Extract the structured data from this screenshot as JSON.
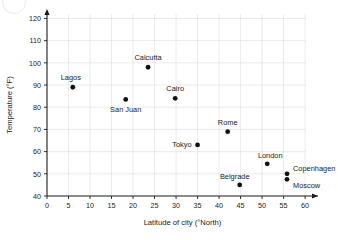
{
  "chart_data": {
    "type": "scatter",
    "title": "",
    "xlabel": "Latitude of city (°North)",
    "ylabel": "Temperature (°F)",
    "xlim": [
      0,
      63
    ],
    "ylim": [
      40,
      122
    ],
    "xticks": [
      0,
      5,
      10,
      15,
      20,
      25,
      30,
      35,
      40,
      45,
      50,
      55,
      60
    ],
    "yticks": [
      40,
      50,
      60,
      70,
      80,
      90,
      100,
      110,
      120
    ],
    "xtick_labels": [
      "0",
      "5",
      "10",
      "15",
      "20",
      "25",
      "30",
      "35",
      "40",
      "45",
      "50",
      "55",
      "60"
    ],
    "ytick_labels": [
      "40",
      "50",
      "60",
      "70",
      "80",
      "90",
      "100",
      "110",
      "120"
    ],
    "grid": true,
    "legend": "none",
    "point_color": "#111111",
    "grid_color": "#e2e2e2",
    "axis_color": "#1a1a1a",
    "points": [
      {
        "label": "Lagos",
        "x": 6.0,
        "y": 89.0,
        "label_dx": -2,
        "label_dy": -7,
        "anchor": "middle"
      },
      {
        "label": "San Juan",
        "x": 18.3,
        "y": 83.5,
        "label_dx": 0,
        "label_dy": 13,
        "anchor": "middle"
      },
      {
        "label": "Calcutta",
        "x": 23.5,
        "y": 98.0,
        "label_dx": 0,
        "label_dy": -7,
        "anchor": "middle"
      },
      {
        "label": "Cairo",
        "x": 29.8,
        "y": 84.0,
        "label_dx": 0,
        "label_dy": -7,
        "anchor": "middle"
      },
      {
        "label": "Tokyo",
        "x": 35.0,
        "y": 63.0,
        "label_dx": -6,
        "label_dy": 2.5,
        "anchor": "end"
      },
      {
        "label": "Rome",
        "x": 42.0,
        "y": 69.0,
        "label_dx": 0,
        "label_dy": -7,
        "anchor": "middle"
      },
      {
        "label": "Belgrade",
        "x": 44.8,
        "y": 45.0,
        "label_dx": -5,
        "label_dy": -6,
        "anchor": "middle"
      },
      {
        "label": "London",
        "x": 51.2,
        "y": 54.5,
        "label_dx": 3,
        "label_dy": -6,
        "anchor": "middle"
      },
      {
        "label": "Copenhagen",
        "x": 55.8,
        "y": 50.0,
        "label_dx": 6,
        "label_dy": -3,
        "anchor": "start"
      },
      {
        "label": "Moscow",
        "x": 55.8,
        "y": 47.5,
        "label_dx": 6,
        "label_dy": 9,
        "anchor": "start"
      }
    ]
  }
}
